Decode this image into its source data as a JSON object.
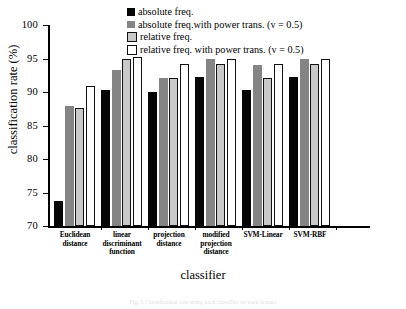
{
  "chart_data": {
    "type": "bar",
    "title": "",
    "xlabel": "classifier",
    "ylabel": "classification rate (%)",
    "ylim": [
      70,
      100
    ],
    "yticks": [
      70,
      75,
      80,
      85,
      90,
      95,
      100
    ],
    "grid": false,
    "legend_position": "top-right-inside",
    "categories": [
      "Euclidean distance",
      "linear discriminant function",
      "projection distance",
      "modified projection distance",
      "SVM-Linear",
      "SVM-RBF"
    ],
    "category_lines": [
      [
        "Euclidean",
        "distance"
      ],
      [
        "linear",
        "discriminant",
        "function"
      ],
      [
        "projection",
        "distance"
      ],
      [
        "modified",
        "projection",
        "distance"
      ],
      [
        "SVM-Linear"
      ],
      [
        "SVM-RBF"
      ]
    ],
    "series": [
      {
        "name": "absolute freq.",
        "color": "#060606",
        "values": [
          73.7,
          90.3,
          90.0,
          92.2,
          90.3,
          92.2
        ]
      },
      {
        "name": "absolute freq.with power trans. (v = 0.5)",
        "color": "#848484",
        "values": [
          87.9,
          93.3,
          92.1,
          95.0,
          94.0,
          95.0
        ]
      },
      {
        "name": "relative freq.",
        "color": "#c9c9c9",
        "values": [
          87.6,
          95.0,
          92.1,
          94.2,
          92.1,
          94.2
        ]
      },
      {
        "name": "relative freq. with power trans. (v = 0.5)",
        "color": "#ffffff",
        "values": [
          90.9,
          95.2,
          94.2,
          95.0,
          94.2,
          95.0
        ]
      }
    ]
  },
  "caption": "Fig. 5  Classification rate using each classifier on each feature"
}
